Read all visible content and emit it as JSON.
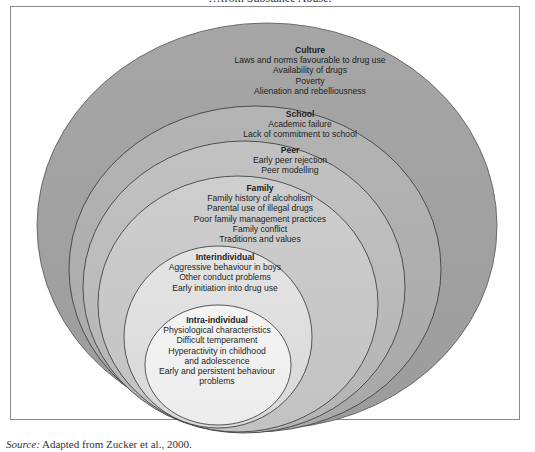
{
  "caption_top": "…from Substance Abuse.",
  "diagram": {
    "layers": [
      {
        "title": "Culture",
        "items": [
          "Laws and norms favourable to drug use",
          "Availability of drugs",
          "Poverty",
          "Alienation and rebelliousness"
        ],
        "fill": "#a3a3a3"
      },
      {
        "title": "School",
        "items": [
          "Academic failure",
          "Lack of commitment to school"
        ],
        "fill": "#b0b0b0"
      },
      {
        "title": "Peer",
        "items": [
          "Early peer rejection",
          "Peer modelling"
        ],
        "fill": "#bdbdbd"
      },
      {
        "title": "Family",
        "items": [
          "Family history of alcoholism",
          "Parental use of illegal drugs",
          "Poor family management practices",
          "Family conflict",
          "Traditions and values"
        ],
        "fill": "#cacaca"
      },
      {
        "title": "Interindividual",
        "items": [
          "Aggressive behaviour in boys",
          "Other conduct problems",
          "Early initiation into drug use"
        ],
        "fill": "#dedede"
      },
      {
        "title": "Intra-individual",
        "items": [
          "Physiological characteristics",
          "Difficult temperament",
          "Hyperactivity in childhood",
          "and adolescence",
          "Early and persistent behaviour",
          "problems"
        ],
        "fill": "#efefef"
      }
    ]
  },
  "source": {
    "label": "Source:",
    "text": "Adapted from Zucker et al., 2000."
  }
}
